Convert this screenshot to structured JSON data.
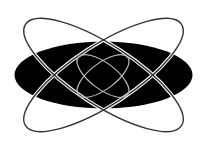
{
  "graphic": {
    "subject": "atom-style orbit emblem",
    "colors": {
      "background": "#ffffff",
      "core": "#000000",
      "outer_orbit_stroke": "#333333",
      "outer_orbit_outline": "#ffffff",
      "inner_orbit_stroke": "#bbbbbb"
    },
    "core_ellipse": {
      "cx": 103.5,
      "cy": 75,
      "rx": 89,
      "ry": 33.5
    },
    "outer_orbits": [
      {
        "cx": 103.5,
        "cy": 75,
        "rx": 93,
        "ry": 30,
        "rotate": 33
      },
      {
        "cx": 103.5,
        "cy": 75,
        "rx": 93,
        "ry": 30,
        "rotate": -33
      }
    ],
    "inner_orbits": [
      {
        "cx": 103,
        "cy": 76,
        "rx": 31,
        "ry": 13,
        "rotate": 37
      },
      {
        "cx": 103,
        "cy": 76,
        "rx": 31,
        "ry": 13,
        "rotate": -37
      }
    ]
  }
}
